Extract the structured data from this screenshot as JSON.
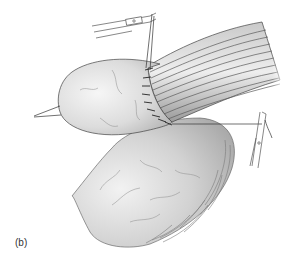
{
  "figure": {
    "panel_label": "(b)",
    "colors": {
      "background": "#ffffff",
      "organ_shade_light": "#f4f4f4",
      "organ_shade_dark": "#b8b8b8",
      "outline": "#444444",
      "fiber_dark": "#5a5a5a",
      "suture": "#222222"
    },
    "elements": [
      {
        "name": "upper-organ-lobe",
        "description": "rounded organ end pulled left by stay sutures"
      },
      {
        "name": "lower-organ-body",
        "description": "large curved organ with ribbed/fibrous edge"
      },
      {
        "name": "fibrous-tube",
        "description": "striated tubular structure extending to upper right"
      },
      {
        "name": "suture-line",
        "description": "interrupted sutures joining tube to organ"
      },
      {
        "name": "upper-hemostat-clamp",
        "description": "clamp at top holding suture tails"
      },
      {
        "name": "right-hemostat-clamp",
        "description": "clamp at right holding suture tail"
      },
      {
        "name": "traction-sutures",
        "description": "two suture strands pulled to the left"
      }
    ]
  }
}
